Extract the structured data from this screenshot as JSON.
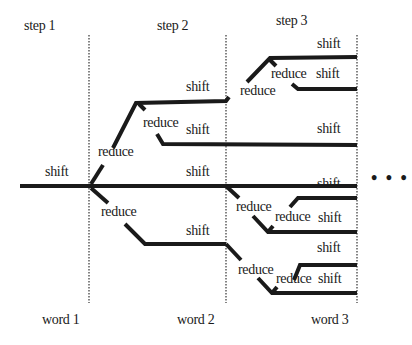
{
  "diagram": {
    "type": "shift-reduce parse search tree",
    "steps": [
      "step 1",
      "step 2",
      "step 3"
    ],
    "words": [
      "word 1",
      "word 2",
      "word 3"
    ],
    "actions": {
      "shift": "shift",
      "reduce": "reduce"
    },
    "continuation": "• • •",
    "edge_labels": [
      {
        "id": "s1-shift",
        "text": "shift"
      },
      {
        "id": "s2-reduce-up",
        "text": "reduce"
      },
      {
        "id": "s2-reduce-down",
        "text": "reduce"
      },
      {
        "id": "s2-top-shift",
        "text": "shift"
      },
      {
        "id": "s2-top-reduce",
        "text": "reduce"
      },
      {
        "id": "s2-mid-shift",
        "text": "shift"
      },
      {
        "id": "s2-main-shift",
        "text": "shift"
      },
      {
        "id": "s2-low-shift",
        "text": "shift"
      },
      {
        "id": "s3-a-reduce",
        "text": "reduce"
      },
      {
        "id": "s3-a-shift",
        "text": "shift"
      },
      {
        "id": "s3-a-reduce2",
        "text": "reduce"
      },
      {
        "id": "s3-a-shift2",
        "text": "shift"
      },
      {
        "id": "s3-b-shift",
        "text": "shift"
      },
      {
        "id": "s3-c-reduce",
        "text": "reduce"
      },
      {
        "id": "s3-c-shift",
        "text": "shift"
      },
      {
        "id": "s3-c-reduce2",
        "text": "reduce"
      },
      {
        "id": "s3-c-shift2",
        "text": "shift"
      },
      {
        "id": "s3-d-reduce",
        "text": "reduce"
      },
      {
        "id": "s3-d-shift",
        "text": "shift"
      },
      {
        "id": "s3-d-reduce2",
        "text": "reduce"
      },
      {
        "id": "s3-d-shift2",
        "text": "shift"
      }
    ]
  }
}
